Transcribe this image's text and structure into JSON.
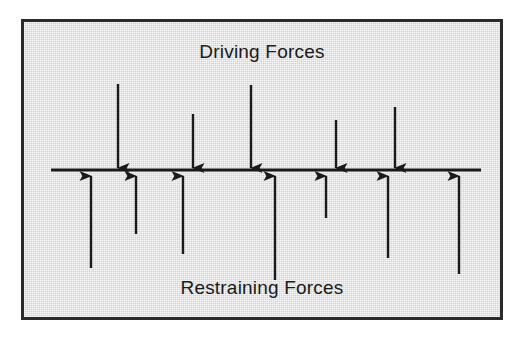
{
  "diagram": {
    "type": "force-field-analysis",
    "title_top": "Driving Forces",
    "title_bottom": "Restraining Forces",
    "colors": {
      "background": "#ffffff",
      "panel_fill": "#d9d9d9",
      "panel_border": "#2b2b2b",
      "arrow": "#1a1a1a",
      "equilibrium_line": "#1a1a1a",
      "text": "#1a1a1a"
    },
    "panel": {
      "x": 21,
      "y": 19,
      "width": 482,
      "height": 301,
      "border_width": 3
    },
    "equilibrium_line": {
      "name": "equilibrium-line",
      "x1": 27,
      "x2": 457,
      "y": 148,
      "thickness": 3
    },
    "driving_forces": {
      "direction": "down",
      "count": 5,
      "arrows": [
        {
          "id": "driving-arrow-1",
          "x": 94,
          "y_start": 62,
          "y_end": 146,
          "length": 84
        },
        {
          "id": "driving-arrow-2",
          "x": 169,
          "y_start": 92,
          "y_end": 146,
          "length": 54
        },
        {
          "id": "driving-arrow-3",
          "x": 227,
          "y_start": 63,
          "y_end": 146,
          "length": 83
        },
        {
          "id": "driving-arrow-4",
          "x": 312,
          "y_start": 98,
          "y_end": 146,
          "length": 48
        },
        {
          "id": "driving-arrow-5",
          "x": 371,
          "y_start": 85,
          "y_end": 146,
          "length": 61
        }
      ]
    },
    "restraining_forces": {
      "direction": "up",
      "count": 7,
      "arrows": [
        {
          "id": "restraining-arrow-1",
          "x": 67,
          "y_start": 246,
          "y_end": 154,
          "length": 92
        },
        {
          "id": "restraining-arrow-2",
          "x": 112,
          "y_start": 212,
          "y_end": 154,
          "length": 58
        },
        {
          "id": "restraining-arrow-3",
          "x": 159,
          "y_start": 232,
          "y_end": 154,
          "length": 78
        },
        {
          "id": "restraining-arrow-4",
          "x": 251,
          "y_start": 258,
          "y_end": 154,
          "length": 104
        },
        {
          "id": "restraining-arrow-5",
          "x": 302,
          "y_start": 196,
          "y_end": 154,
          "length": 42
        },
        {
          "id": "restraining-arrow-6",
          "x": 364,
          "y_start": 236,
          "y_end": 154,
          "length": 82
        },
        {
          "id": "restraining-arrow-7",
          "x": 435,
          "y_start": 252,
          "y_end": 154,
          "length": 98
        }
      ]
    }
  }
}
